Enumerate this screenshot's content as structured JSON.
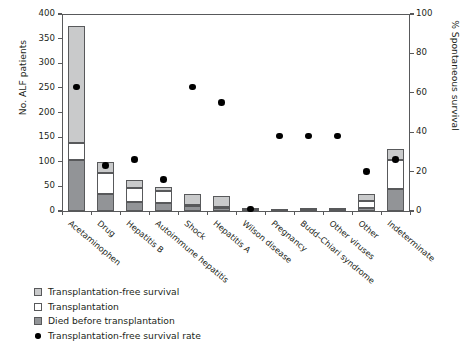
{
  "chart_data": {
    "type": "bar",
    "title": "",
    "xlabel": "",
    "ylabel": "No. ALF patients",
    "y2label": "% Spontaneous survival",
    "ylim": [
      0,
      400
    ],
    "y2lim": [
      0,
      100
    ],
    "yticks": [
      "0",
      "50",
      "100",
      "150",
      "200",
      "250",
      "300",
      "350",
      "400"
    ],
    "y2ticks": [
      "0",
      "20",
      "40",
      "60",
      "80",
      "100"
    ],
    "grid": false,
    "legend_position": "below-left",
    "categories": [
      "Acetaminophen",
      "Drug",
      "Hepatitis B",
      "Autoimmune hepatitis",
      "Shock",
      "Hepatitis A",
      "Wilson disease",
      "Pregnancy",
      "Budd–Chiari syndrome",
      "Other viruses",
      "Other",
      "Indeterminate"
    ],
    "series": [
      {
        "name": "Died before transplantation",
        "values": [
          103,
          34,
          19,
          17,
          11,
          6,
          2,
          2,
          3,
          3,
          7,
          45
        ]
      },
      {
        "name": "Transplantation",
        "values": [
          35,
          44,
          27,
          23,
          2,
          2,
          4,
          0,
          0,
          0,
          13,
          58
        ]
      },
      {
        "name": "Transplantation-free survival",
        "values": [
          237,
          22,
          16,
          9,
          22,
          23,
          1,
          2,
          4,
          4,
          15,
          22
        ]
      }
    ],
    "totals": [
      375,
      100,
      62,
      49,
      35,
      31,
      7,
      4,
      7,
      7,
      35,
      125
    ],
    "survival_rate": {
      "name": "Transplantation-free survival rate",
      "units": "%",
      "values": [
        63,
        23,
        26,
        16,
        63,
        55,
        1,
        38,
        38,
        38,
        20,
        26
      ]
    }
  },
  "legend": {
    "items": [
      {
        "label": "Transplantation-free survival",
        "swatch": "light-gray-square"
      },
      {
        "label": "Transplantation",
        "swatch": "white-square"
      },
      {
        "label": "Died before transplantation",
        "swatch": "dark-gray-square"
      },
      {
        "label": "Transplantation-free survival rate",
        "swatch": "black-dot"
      }
    ]
  },
  "colors": {
    "free_survival": "#c9cacb",
    "transplantation": "#ffffff",
    "died": "#929497",
    "dot": "#000000",
    "axis": "#58595b",
    "text": "#231f20"
  }
}
